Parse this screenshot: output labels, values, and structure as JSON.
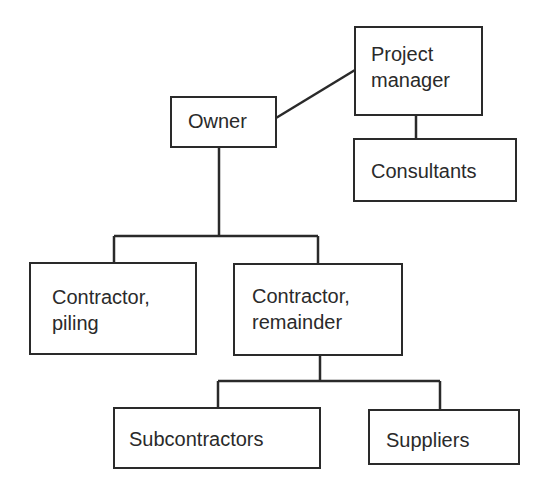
{
  "diagram": {
    "type": "organization-chart",
    "nodes": {
      "owner": {
        "label": "Owner"
      },
      "project_manager": {
        "line1": "Project",
        "line2": "manager"
      },
      "consultants": {
        "label": "Consultants"
      },
      "contractor_piling": {
        "line1": "Contractor,",
        "line2": "piling"
      },
      "contractor_remainder": {
        "line1": "Contractor,",
        "line2": "remainder"
      },
      "subcontractors": {
        "label": "Subcontractors"
      },
      "suppliers": {
        "label": "Suppliers"
      }
    },
    "edges": [
      {
        "from": "Owner",
        "to": "Project manager"
      },
      {
        "from": "Project manager",
        "to": "Consultants"
      },
      {
        "from": "Owner",
        "to": "Contractor, piling"
      },
      {
        "from": "Owner",
        "to": "Contractor, remainder"
      },
      {
        "from": "Contractor, remainder",
        "to": "Subcontractors"
      },
      {
        "from": "Contractor, remainder",
        "to": "Suppliers"
      }
    ],
    "colors": {
      "line": "#2a2a2a",
      "background": "#ffffff"
    }
  }
}
